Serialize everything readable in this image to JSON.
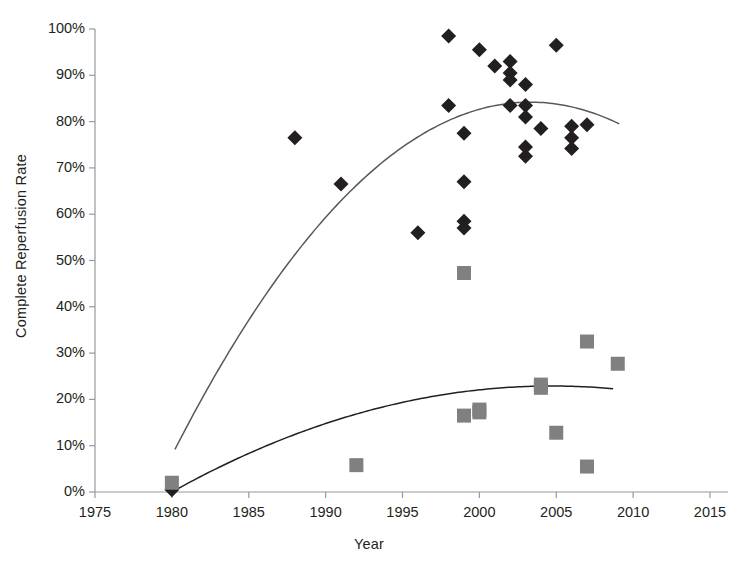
{
  "chart_data": {
    "type": "scatter",
    "title": "",
    "xlabel": "Year",
    "ylabel": "Complete Reperfusion Rate",
    "xlim": [
      1975,
      2015
    ],
    "ylim": [
      0,
      1.0
    ],
    "grid": false,
    "legend": "none",
    "xticks": [
      "1975",
      "1980",
      "1985",
      "1990",
      "1995",
      "2000",
      "2005",
      "2010",
      "2015"
    ],
    "xtick_values": [
      1975,
      1980,
      1985,
      1990,
      1995,
      2000,
      2005,
      2010,
      2015
    ],
    "yticks": [
      "0%",
      "10%",
      "20%",
      "30%",
      "40%",
      "50%",
      "60%",
      "70%",
      "80%",
      "90%",
      "100%"
    ],
    "ytick_values": [
      0,
      0.1,
      0.2,
      0.3,
      0.4,
      0.5,
      0.6,
      0.7,
      0.8,
      0.9,
      1.0
    ],
    "series": [
      {
        "name": "Diamond series",
        "marker": "diamond",
        "color": "#231f20",
        "points": [
          [
            1980,
            0.005
          ],
          [
            1988,
            0.765
          ],
          [
            1991,
            0.665
          ],
          [
            1996,
            0.56
          ],
          [
            1998,
            0.985
          ],
          [
            1998,
            0.835
          ],
          [
            1999,
            0.585
          ],
          [
            1999,
            0.57
          ],
          [
            1999,
            0.775
          ],
          [
            1999,
            0.67
          ],
          [
            2000,
            0.955
          ],
          [
            2001,
            0.92
          ],
          [
            2002,
            0.93
          ],
          [
            2002,
            0.905
          ],
          [
            2002,
            0.89
          ],
          [
            2002,
            0.835
          ],
          [
            2003,
            0.88
          ],
          [
            2003,
            0.835
          ],
          [
            2003,
            0.81
          ],
          [
            2003,
            0.745
          ],
          [
            2003,
            0.725
          ],
          [
            2004,
            0.785
          ],
          [
            2005,
            0.965
          ],
          [
            2006,
            0.79
          ],
          [
            2006,
            0.765
          ],
          [
            2006,
            0.742
          ],
          [
            2007,
            0.793
          ]
        ]
      },
      {
        "name": "Square series",
        "marker": "square",
        "color": "#808080",
        "points": [
          [
            1980,
            0.02
          ],
          [
            1992,
            0.058
          ],
          [
            1999,
            0.473
          ],
          [
            1999,
            0.165
          ],
          [
            2000,
            0.172
          ],
          [
            2000,
            0.178
          ],
          [
            2004,
            0.232
          ],
          [
            2004,
            0.225
          ],
          [
            2005,
            0.128
          ],
          [
            2007,
            0.325
          ],
          [
            2007,
            0.055
          ],
          [
            2009,
            0.277
          ]
        ]
      }
    ],
    "trendlines": [
      {
        "name": "Upper trend (diamond series)",
        "color": "#595959",
        "x_start": 1980.2,
        "x_end": 2009.1,
        "peak_x": 2005.0,
        "peak_y": 0.838,
        "y_start": 0.092,
        "y_end": 0.795
      },
      {
        "name": "Lower trend (square series)",
        "color": "#231f20",
        "x_start": 1980.0,
        "x_end": 2008.7,
        "peak_x": 2007.0,
        "peak_y": 0.227,
        "y_start": 0.0,
        "y_end": 0.223
      }
    ]
  }
}
